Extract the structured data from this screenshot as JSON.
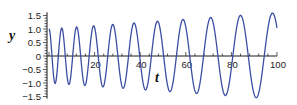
{
  "chart_data": {
    "type": "line",
    "title": "",
    "xlabel": "t",
    "ylabel": "y",
    "xlim": [
      0,
      100
    ],
    "ylim": [
      -1.6,
      1.7
    ],
    "grid": false,
    "legend": null,
    "x_ticks": {
      "major": [
        20,
        40,
        60,
        80,
        100
      ],
      "labels": [
        "20",
        "40",
        "60",
        "80",
        "100"
      ],
      "minor_step": 4
    },
    "y_ticks": {
      "major": [
        -1.5,
        -1.0,
        -0.5,
        0,
        0.5,
        1.0,
        1.5
      ],
      "labels": [
        "−1.5",
        "−1.0",
        "−0.5",
        "0",
        "0.5",
        "1.0",
        "1.5"
      ],
      "minor_step": 0.1
    },
    "series": [
      {
        "name": "y(t)",
        "color": "#3b4ea3",
        "description": "oscillation with slowly increasing period and slowly increasing amplitude",
        "model": {
          "amp0": 1.0,
          "amp_slope": 0.006,
          "peak_index_a": 5.12,
          "peak_index_b": 0.468
        },
        "peaks": [
          {
            "t": 0,
            "y": 1.0
          },
          {
            "t": 6.1,
            "y": 1.0
          },
          {
            "t": 13.2,
            "y": 1.05
          },
          {
            "t": 21.1,
            "y": 1.1
          },
          {
            "t": 28.9,
            "y": 1.15
          },
          {
            "t": 37.3,
            "y": 1.2
          },
          {
            "t": 47.4,
            "y": 1.27
          },
          {
            "t": 57.9,
            "y": 1.33
          },
          {
            "t": 70.2,
            "y": 1.4
          },
          {
            "t": 83.3,
            "y": 1.5
          },
          {
            "t": 100,
            "y": 1.6
          }
        ],
        "troughs": [
          {
            "t": 2.6,
            "y": -1.0
          },
          {
            "t": 10,
            "y": -1.03
          },
          {
            "t": 17,
            "y": -1.07
          },
          {
            "t": 24.6,
            "y": -1.12
          },
          {
            "t": 33.3,
            "y": -1.17
          },
          {
            "t": 42.1,
            "y": -1.23
          },
          {
            "t": 51.8,
            "y": -1.3
          },
          {
            "t": 64,
            "y": -1.38
          },
          {
            "t": 77,
            "y": -1.45
          },
          {
            "t": 91,
            "y": -1.52
          }
        ]
      }
    ]
  },
  "colors": {
    "curve": "#3b4ea3",
    "axis": "#1a1a1a"
  }
}
